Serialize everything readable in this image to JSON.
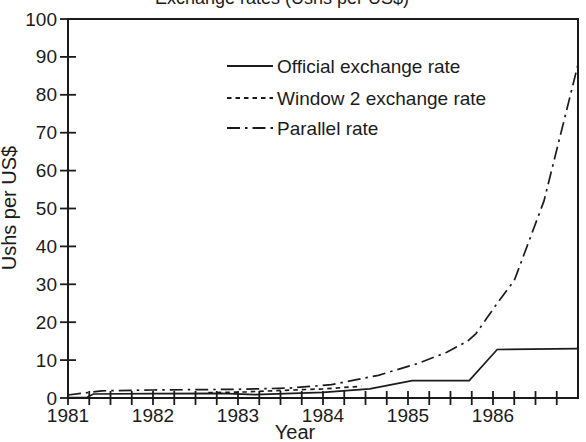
{
  "figure": {
    "cropped_title_fragment": "Exchange rates (Ushs per US$)",
    "title_cropped_at_top_edge": true,
    "background_color": "#ffffff",
    "line_color": "#1b1b1b"
  },
  "chart_data": {
    "type": "line",
    "xlabel": "Year",
    "ylabel": "Ushs per US$",
    "x_range": [
      1981,
      1987
    ],
    "ylim": [
      0,
      100
    ],
    "y_ticks": [
      0,
      10,
      20,
      30,
      40,
      50,
      60,
      70,
      80,
      90,
      100
    ],
    "x_tick_years": [
      1981,
      1982,
      1983,
      1984,
      1985,
      1986
    ],
    "x_minor_tick_step": 0.25,
    "grid": false,
    "legend_position": "upper left inside plot",
    "series": [
      {
        "name": "Official exchange rate",
        "style": "solid",
        "points": [
          [
            1981.0,
            0.1
          ],
          [
            1981.22,
            0.12
          ],
          [
            1981.3,
            1.05
          ],
          [
            1982.0,
            1.15
          ],
          [
            1982.8,
            1.25
          ],
          [
            1983.2,
            0.9
          ],
          [
            1984.0,
            1.5
          ],
          [
            1984.55,
            2.4
          ],
          [
            1985.05,
            4.6
          ],
          [
            1985.72,
            4.6
          ],
          [
            1986.05,
            12.8
          ],
          [
            1987.0,
            13.0
          ]
        ]
      },
      {
        "name": "Window 2 exchange rate",
        "style": "dashed",
        "points": [
          [
            1982.65,
            1.4
          ],
          [
            1983.1,
            1.6
          ],
          [
            1983.4,
            1.9
          ],
          [
            1984.0,
            2.4
          ],
          [
            1984.45,
            3.1
          ]
        ]
      },
      {
        "name": "Parallel rate",
        "style": "dash-dot",
        "points": [
          [
            1981.0,
            0.8
          ],
          [
            1981.4,
            1.9
          ],
          [
            1982.0,
            2.1
          ],
          [
            1983.0,
            2.3
          ],
          [
            1983.6,
            2.6
          ],
          [
            1984.1,
            3.5
          ],
          [
            1984.65,
            6.0
          ],
          [
            1985.1,
            9.0
          ],
          [
            1985.45,
            12.0
          ],
          [
            1985.7,
            15.0
          ],
          [
            1985.8,
            17.0
          ],
          [
            1986.05,
            25.0
          ],
          [
            1986.25,
            31.0
          ],
          [
            1986.6,
            52.0
          ],
          [
            1987.0,
            88.0
          ]
        ]
      }
    ]
  }
}
